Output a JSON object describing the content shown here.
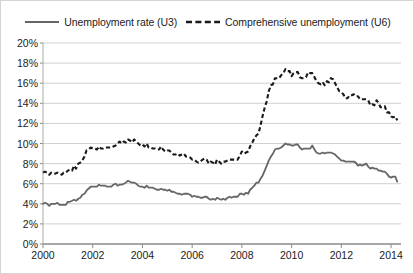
{
  "legend": {
    "position": "top-center",
    "entries": [
      {
        "label": "Unemployment rate (U3)",
        "style": "solid",
        "color": "#666666"
      },
      {
        "label": "Comprehensive unemployment (U6)",
        "style": "dashed",
        "color": "#1a1a1a"
      }
    ]
  },
  "chart_data": {
    "type": "line",
    "title": "",
    "subtitle": "",
    "xlabel": "",
    "ylabel": "",
    "xlim": [
      2000,
      2014.4
    ],
    "ylim": [
      0,
      20
    ],
    "grid": true,
    "gridlines_horizontal": true,
    "gridlines_vertical": false,
    "legend_position": "top-center",
    "y_tick_labels": [
      "0%",
      "2%",
      "4%",
      "6%",
      "8%",
      "10%",
      "12%",
      "14%",
      "16%",
      "18%",
      "20%"
    ],
    "y_ticks": [
      0,
      2,
      4,
      6,
      8,
      10,
      12,
      14,
      16,
      18,
      20
    ],
    "x_tick_labels": [
      "2000",
      "2002",
      "2004",
      "2006",
      "2008",
      "2010",
      "2012",
      "2014"
    ],
    "x_ticks": [
      2000,
      2002,
      2004,
      2006,
      2008,
      2010,
      2012,
      2014
    ],
    "y_unit": "percent",
    "series": [
      {
        "name": "Unemployment rate (U3)",
        "color": "#666666",
        "style": "solid",
        "x": [
          2000.0,
          2000.08,
          2000.17,
          2000.25,
          2000.33,
          2000.42,
          2000.5,
          2000.58,
          2000.67,
          2000.75,
          2000.83,
          2000.92,
          2001.0,
          2001.08,
          2001.17,
          2001.25,
          2001.33,
          2001.42,
          2001.5,
          2001.58,
          2001.67,
          2001.75,
          2001.83,
          2001.92,
          2002.0,
          2002.08,
          2002.17,
          2002.25,
          2002.33,
          2002.42,
          2002.5,
          2002.58,
          2002.67,
          2002.75,
          2002.83,
          2002.92,
          2003.0,
          2003.08,
          2003.17,
          2003.25,
          2003.33,
          2003.42,
          2003.5,
          2003.58,
          2003.67,
          2003.75,
          2003.83,
          2003.92,
          2004.0,
          2004.08,
          2004.17,
          2004.25,
          2004.33,
          2004.42,
          2004.5,
          2004.58,
          2004.67,
          2004.75,
          2004.83,
          2004.92,
          2005.0,
          2005.08,
          2005.17,
          2005.25,
          2005.33,
          2005.42,
          2005.5,
          2005.58,
          2005.67,
          2005.75,
          2005.83,
          2005.92,
          2006.0,
          2006.08,
          2006.17,
          2006.25,
          2006.33,
          2006.42,
          2006.5,
          2006.58,
          2006.67,
          2006.75,
          2006.83,
          2006.92,
          2007.0,
          2007.08,
          2007.17,
          2007.25,
          2007.33,
          2007.42,
          2007.5,
          2007.58,
          2007.67,
          2007.75,
          2007.83,
          2007.92,
          2008.0,
          2008.08,
          2008.17,
          2008.25,
          2008.33,
          2008.42,
          2008.5,
          2008.58,
          2008.67,
          2008.75,
          2008.83,
          2008.92,
          2009.0,
          2009.08,
          2009.17,
          2009.25,
          2009.33,
          2009.42,
          2009.5,
          2009.58,
          2009.67,
          2009.75,
          2009.83,
          2009.92,
          2010.0,
          2010.08,
          2010.17,
          2010.25,
          2010.33,
          2010.42,
          2010.5,
          2010.58,
          2010.67,
          2010.75,
          2010.83,
          2010.92,
          2011.0,
          2011.08,
          2011.17,
          2011.25,
          2011.33,
          2011.42,
          2011.5,
          2011.58,
          2011.67,
          2011.75,
          2011.83,
          2011.92,
          2012.0,
          2012.08,
          2012.17,
          2012.25,
          2012.33,
          2012.42,
          2012.5,
          2012.58,
          2012.67,
          2012.75,
          2012.83,
          2012.92,
          2013.0,
          2013.08,
          2013.17,
          2013.25,
          2013.33,
          2013.42,
          2013.5,
          2013.58,
          2013.67,
          2013.75,
          2013.83,
          2013.92,
          2014.0,
          2014.08,
          2014.17,
          2014.25
        ],
        "values": [
          4.0,
          4.1,
          4.0,
          3.8,
          4.0,
          4.0,
          4.0,
          4.1,
          3.9,
          3.9,
          3.9,
          3.9,
          4.2,
          4.2,
          4.3,
          4.4,
          4.3,
          4.5,
          4.6,
          4.9,
          5.0,
          5.3,
          5.5,
          5.7,
          5.7,
          5.7,
          5.7,
          5.9,
          5.8,
          5.8,
          5.8,
          5.7,
          5.7,
          5.7,
          5.9,
          6.0,
          5.8,
          5.9,
          5.9,
          6.0,
          6.1,
          6.3,
          6.2,
          6.1,
          6.1,
          6.0,
          5.8,
          5.7,
          5.7,
          5.6,
          5.8,
          5.6,
          5.6,
          5.6,
          5.5,
          5.4,
          5.4,
          5.5,
          5.4,
          5.4,
          5.3,
          5.4,
          5.2,
          5.2,
          5.1,
          5.0,
          5.0,
          4.9,
          5.0,
          5.0,
          5.0,
          4.9,
          4.7,
          4.8,
          4.7,
          4.7,
          4.6,
          4.6,
          4.7,
          4.7,
          4.5,
          4.4,
          4.5,
          4.4,
          4.6,
          4.5,
          4.4,
          4.5,
          4.4,
          4.6,
          4.7,
          4.6,
          4.7,
          4.7,
          4.7,
          5.0,
          5.0,
          4.9,
          5.1,
          5.0,
          5.4,
          5.6,
          5.8,
          6.1,
          6.1,
          6.5,
          6.8,
          7.3,
          7.8,
          8.3,
          8.7,
          9.0,
          9.4,
          9.5,
          9.5,
          9.6,
          9.8,
          10.0,
          9.9,
          9.9,
          9.8,
          9.8,
          9.9,
          9.9,
          9.6,
          9.4,
          9.5,
          9.5,
          9.5,
          9.5,
          9.8,
          9.4,
          9.1,
          9.0,
          9.0,
          9.1,
          9.0,
          9.1,
          9.1,
          9.1,
          9.0,
          8.9,
          8.7,
          8.5,
          8.3,
          8.3,
          8.2,
          8.2,
          8.2,
          8.2,
          8.2,
          8.1,
          7.8,
          7.9,
          7.8,
          7.9,
          8.0,
          7.7,
          7.5,
          7.6,
          7.5,
          7.5,
          7.3,
          7.3,
          7.2,
          7.2,
          7.0,
          6.7,
          6.6,
          6.7,
          6.7,
          6.2
        ]
      },
      {
        "name": "Comprehensive unemployment (U6)",
        "color": "#1a1a1a",
        "style": "dashed",
        "x": [
          2000.0,
          2000.08,
          2000.17,
          2000.25,
          2000.33,
          2000.42,
          2000.5,
          2000.58,
          2000.67,
          2000.75,
          2000.83,
          2000.92,
          2001.0,
          2001.08,
          2001.17,
          2001.25,
          2001.33,
          2001.42,
          2001.5,
          2001.58,
          2001.67,
          2001.75,
          2001.83,
          2001.92,
          2002.0,
          2002.08,
          2002.17,
          2002.25,
          2002.33,
          2002.42,
          2002.5,
          2002.58,
          2002.67,
          2002.75,
          2002.83,
          2002.92,
          2003.0,
          2003.08,
          2003.17,
          2003.25,
          2003.33,
          2003.42,
          2003.5,
          2003.58,
          2003.67,
          2003.75,
          2003.83,
          2003.92,
          2004.0,
          2004.08,
          2004.17,
          2004.25,
          2004.33,
          2004.42,
          2004.5,
          2004.58,
          2004.67,
          2004.75,
          2004.83,
          2004.92,
          2005.0,
          2005.08,
          2005.17,
          2005.25,
          2005.33,
          2005.42,
          2005.5,
          2005.58,
          2005.67,
          2005.75,
          2005.83,
          2005.92,
          2006.0,
          2006.08,
          2006.17,
          2006.25,
          2006.33,
          2006.42,
          2006.5,
          2006.58,
          2006.67,
          2006.75,
          2006.83,
          2006.92,
          2007.0,
          2007.08,
          2007.17,
          2007.25,
          2007.33,
          2007.42,
          2007.5,
          2007.58,
          2007.67,
          2007.75,
          2007.83,
          2007.92,
          2008.0,
          2008.08,
          2008.17,
          2008.25,
          2008.33,
          2008.42,
          2008.5,
          2008.58,
          2008.67,
          2008.75,
          2008.83,
          2008.92,
          2009.0,
          2009.08,
          2009.17,
          2009.25,
          2009.33,
          2009.42,
          2009.5,
          2009.58,
          2009.67,
          2009.75,
          2009.83,
          2009.92,
          2010.0,
          2010.08,
          2010.17,
          2010.25,
          2010.33,
          2010.42,
          2010.5,
          2010.58,
          2010.67,
          2010.75,
          2010.83,
          2010.92,
          2011.0,
          2011.08,
          2011.17,
          2011.25,
          2011.33,
          2011.42,
          2011.5,
          2011.58,
          2011.67,
          2011.75,
          2011.83,
          2011.92,
          2012.0,
          2012.08,
          2012.17,
          2012.25,
          2012.33,
          2012.42,
          2012.5,
          2012.58,
          2012.67,
          2012.75,
          2012.83,
          2012.92,
          2013.0,
          2013.08,
          2013.17,
          2013.25,
          2013.33,
          2013.42,
          2013.5,
          2013.58,
          2013.67,
          2013.75,
          2013.83,
          2013.92,
          2014.0,
          2014.08,
          2014.17,
          2014.25
        ],
        "values": [
          7.1,
          7.2,
          7.1,
          6.9,
          7.1,
          7.0,
          7.0,
          7.1,
          7.0,
          6.9,
          7.1,
          7.1,
          7.3,
          7.4,
          7.3,
          7.8,
          7.5,
          8.0,
          8.1,
          8.3,
          8.7,
          9.3,
          9.4,
          9.6,
          9.5,
          9.5,
          9.4,
          9.7,
          9.5,
          9.5,
          9.6,
          9.6,
          9.6,
          9.6,
          9.7,
          9.8,
          10.0,
          10.2,
          10.0,
          10.2,
          10.1,
          10.4,
          10.3,
          10.1,
          10.4,
          10.2,
          10.0,
          9.8,
          9.9,
          9.7,
          10.0,
          9.6,
          9.6,
          9.5,
          9.5,
          9.4,
          9.4,
          9.7,
          9.4,
          9.2,
          9.3,
          9.3,
          9.1,
          8.9,
          8.9,
          9.0,
          8.8,
          8.9,
          9.0,
          8.7,
          8.7,
          8.6,
          8.4,
          8.4,
          8.2,
          8.1,
          8.2,
          8.4,
          8.5,
          8.4,
          8.0,
          8.2,
          8.1,
          7.9,
          8.4,
          8.2,
          8.0,
          8.2,
          8.2,
          8.3,
          8.4,
          8.4,
          8.4,
          8.4,
          8.4,
          8.8,
          9.2,
          9.0,
          9.1,
          9.2,
          9.7,
          10.1,
          10.5,
          10.8,
          11.0,
          11.8,
          12.7,
          13.6,
          14.2,
          15.2,
          15.8,
          15.9,
          16.5,
          16.5,
          16.5,
          16.8,
          17.0,
          17.4,
          17.2,
          17.2,
          16.7,
          17.0,
          17.1,
          17.1,
          16.6,
          16.5,
          16.5,
          16.6,
          17.1,
          17.0,
          17.0,
          16.6,
          16.2,
          16.0,
          15.9,
          16.1,
          15.8,
          16.2,
          16.1,
          16.5,
          16.4,
          16.0,
          15.6,
          15.2,
          15.1,
          14.9,
          14.5,
          14.5,
          14.8,
          14.8,
          14.9,
          14.7,
          14.7,
          14.4,
          14.4,
          14.4,
          14.4,
          14.3,
          13.8,
          13.9,
          13.8,
          14.3,
          14.0,
          13.6,
          13.6,
          13.7,
          13.1,
          13.1,
          12.7,
          12.6,
          12.7,
          12.3
        ]
      }
    ]
  }
}
